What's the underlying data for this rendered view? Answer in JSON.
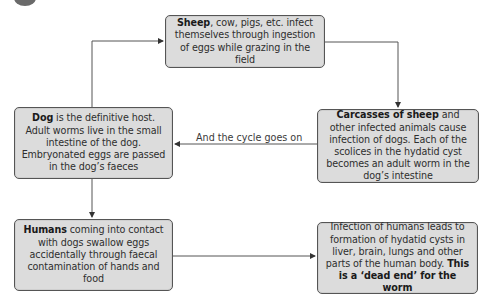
{
  "diagram": {
    "type": "flowchart",
    "topic": "Hydatid disease (Echinococcus) life cycle",
    "nodes": [
      {
        "id": "sheep",
        "bold": "Sheep",
        "text": ", cow, pigs, etc. infect themselves through ingestion of eggs while grazing in the field",
        "bold_suffix": ""
      },
      {
        "id": "carcass",
        "bold": "Carcasses of sheep",
        "text": " and other infected animals cause infection of dogs. Each of the scolices in the hydatid cyst becomes an adult worm in the dog’s intestine",
        "bold_suffix": ""
      },
      {
        "id": "dog",
        "bold": "Dog",
        "text": " is the definitive host. Adult worms live in the small intestine of the dog. Embryonated eggs are passed in the dog’s faeces",
        "bold_suffix": ""
      },
      {
        "id": "humans",
        "bold": "Humans",
        "text": " coming into contact with dogs swallow eggs accidentally through faecal contamination of hands and food",
        "bold_suffix": ""
      },
      {
        "id": "infect",
        "bold": "",
        "text": "Infection of humans leads to formation of hydatid cysts in liver, brain, lungs and other parts of the human body. ",
        "bold_suffix": "This is a ‘dead end’ for the worm"
      }
    ],
    "edges": [
      {
        "from": "dog",
        "to": "sheep",
        "label": ""
      },
      {
        "from": "sheep",
        "to": "carcass",
        "label": ""
      },
      {
        "from": "carcass",
        "to": "dog",
        "label": "And the cycle goes on"
      },
      {
        "from": "dog",
        "to": "humans",
        "label": ""
      },
      {
        "from": "humans",
        "to": "infect",
        "label": ""
      }
    ],
    "colors": {
      "box_fill": "#dcdcdc",
      "box_border": "#555555",
      "line": "#555555"
    }
  }
}
